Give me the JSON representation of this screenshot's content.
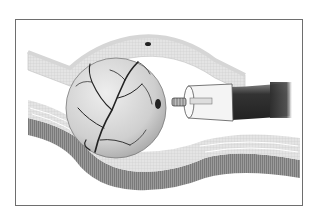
{
  "figure": {
    "elements": [
      "tissue-layers",
      "vascular-sphere",
      "endoscope-instrument",
      "small-dark-spot"
    ],
    "colors": {
      "frame": "#6e6e6e",
      "tissue_light": "#d9d9d9",
      "tissue_dark": "#8a8a8a",
      "sphere": "#cfcfcf",
      "vessels": "#2a2a2a",
      "tube": "#444444"
    }
  }
}
